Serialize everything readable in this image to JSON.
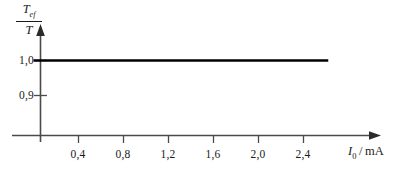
{
  "chart_data": {
    "type": "line",
    "title": "",
    "subtitle": "",
    "xlabel": "I_0 / mA",
    "xlabel_symbol": "I",
    "xlabel_subscript": "0",
    "xlabel_separator": "/",
    "xlabel_unit": "mA",
    "ylabel": "T_ef / T",
    "ylabel_numerator": "T",
    "ylabel_numerator_subscript": "ef",
    "ylabel_denominator": "T",
    "xticks": [
      "0,4",
      "0,8",
      "1,2",
      "1,6",
      "2,0",
      "2,4"
    ],
    "xtick_values": [
      0.4,
      0.8,
      1.2,
      1.6,
      2.0,
      2.4
    ],
    "yticks": [
      "1,0",
      "0,9"
    ],
    "ytick_values": [
      1.0,
      0.9
    ],
    "xlim": [
      0.0,
      2.95
    ],
    "ylim": [
      0.855,
      1.045
    ],
    "grid": false,
    "legend": "none",
    "series": [
      {
        "name": "T_ef/T",
        "x": [
          0.0,
          2.62
        ],
        "values": [
          1.0,
          1.0
        ],
        "style": "solid",
        "color": "#000000",
        "width": 2.6
      }
    ],
    "annotations": [],
    "axis_color": "#4a4a4a",
    "axis_arrow_x": true,
    "axis_arrow_y": true,
    "background": "#ffffff"
  }
}
